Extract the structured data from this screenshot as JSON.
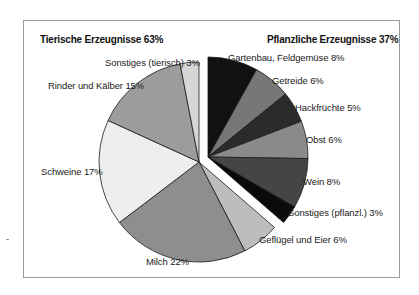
{
  "chart_data": {
    "type": "pie",
    "title": "",
    "groups": [
      {
        "name": "Tierische Erzeugnisse",
        "total_label": "Tierische Erzeugnisse 63%",
        "value": 63
      },
      {
        "name": "Pflanzliche Erzeugnisse",
        "total_label": "Pflanzliche Erzeugnisse 37%",
        "value": 37,
        "exploded": true
      }
    ],
    "slices": [
      {
        "label": "Gartenbau, Feldgemüse",
        "value": 8,
        "group": "Pflanzliche Erzeugnisse",
        "color": "#111111",
        "text": "Gartenbau, Feldgemüse  8%"
      },
      {
        "label": "Getreide",
        "value": 6,
        "group": "Pflanzliche Erzeugnisse",
        "color": "#777777",
        "text": "Getreide 6%"
      },
      {
        "label": "Hackfrüchte",
        "value": 5,
        "group": "Pflanzliche Erzeugnisse",
        "color": "#2b2b2b",
        "text": "Hackfrüchte  5%"
      },
      {
        "label": "Obst",
        "value": 6,
        "group": "Pflanzliche Erzeugnisse",
        "color": "#8a8a8a",
        "text": "Obst  6%"
      },
      {
        "label": "Wein",
        "value": 8,
        "group": "Pflanzliche Erzeugnisse",
        "color": "#454545",
        "text": "Wein  8%"
      },
      {
        "label": "Sonstiges (pflanzl.)",
        "value": 3,
        "group": "Pflanzliche Erzeugnisse",
        "color": "#0a0a0a",
        "text": "Sonstiges (pflanzl.)  3%"
      },
      {
        "label": "Geflügel und Eier",
        "value": 6,
        "group": "Tierische Erzeugnisse",
        "color": "#bdbdbd",
        "text": "Geflügel und Eier  6%"
      },
      {
        "label": "Milch",
        "value": 22,
        "group": "Tierische Erzeugnisse",
        "color": "#8e8e8e",
        "text": "Milch  22%"
      },
      {
        "label": "Schweine",
        "value": 17,
        "group": "Tierische Erzeugnisse",
        "color": "#eeeeee",
        "text": "Schweine  17%"
      },
      {
        "label": "Rinder und Kälber",
        "value": 15,
        "group": "Tierische Erzeugnisse",
        "color": "#9c9c9c",
        "text": "Rinder und Kälber  15%"
      },
      {
        "label": "Sonstiges (tierisch)",
        "value": 3,
        "group": "Tierische Erzeugnisse",
        "color": "#d6d6d6",
        "text": "Sonstiges (tierisch)  3%"
      }
    ],
    "start_angle_deg": 0,
    "direction": "clockwise",
    "legend": "none (direct labels)"
  },
  "headings": {
    "left": "Tierische Erzeugnisse 63%",
    "right": "Pflanzliche Erzeugnisse 37%"
  }
}
